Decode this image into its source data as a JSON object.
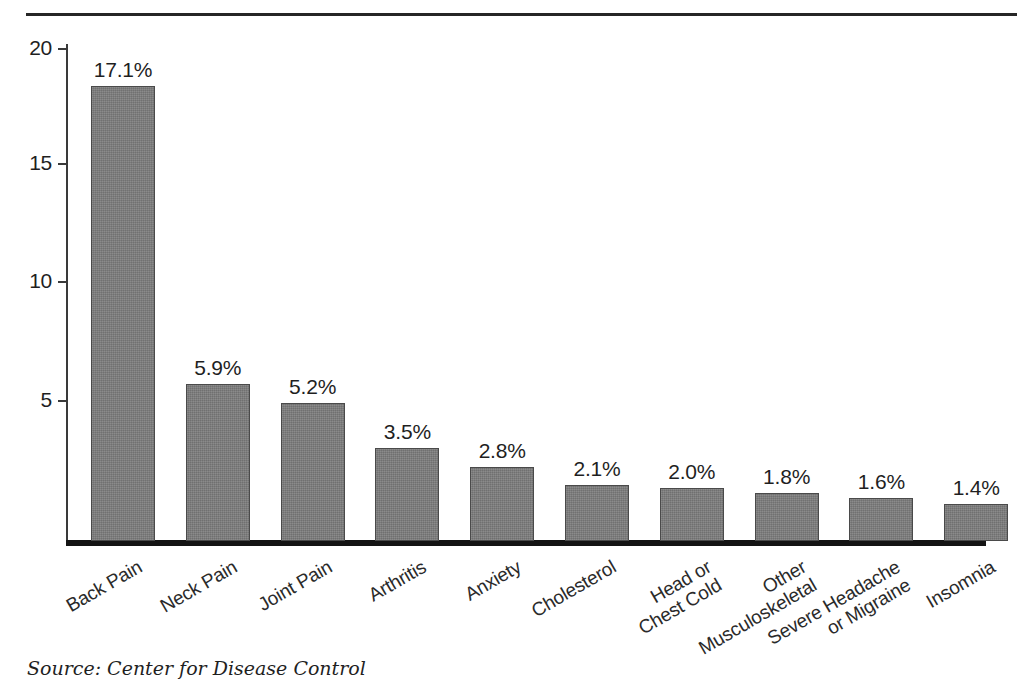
{
  "chart_data": {
    "type": "bar",
    "title": "",
    "subtitle": "",
    "xlabel": "",
    "ylabel": "",
    "ylim": [
      0,
      21
    ],
    "yticks": [
      5,
      10,
      15,
      20
    ],
    "ytick_labels": [
      "5",
      "10",
      "15",
      "20"
    ],
    "grid": false,
    "legend": false,
    "source_note": "Source: Center for Disease Control",
    "value_suffix": "%",
    "bar_color": "#7d7d7d",
    "bar_edge_color": "#4a4a4a",
    "axis_color": "#262626",
    "categories": [
      "Back Pain",
      "Neck Pain",
      "Joint Pain",
      "Arthritis",
      "Anxiety",
      "Cholesterol",
      "Head or Chest Cold",
      "Other Musculoskeletal",
      "Severe Headache or Migraine",
      "Insomnia"
    ],
    "category_lines": [
      [
        "Back Pain"
      ],
      [
        "Neck Pain"
      ],
      [
        "Joint Pain"
      ],
      [
        "Arthritis"
      ],
      [
        "Anxiety"
      ],
      [
        "Cholesterol"
      ],
      [
        "Head or",
        "Chest Cold"
      ],
      [
        "Other",
        "Musculoskeletal"
      ],
      [
        "Severe Headache",
        "or Migraine"
      ],
      [
        "Insomnia"
      ]
    ],
    "values": [
      17.1,
      5.9,
      5.2,
      3.5,
      2.8,
      2.1,
      2.0,
      1.8,
      1.6,
      1.4
    ],
    "value_labels": [
      "17.1%",
      "5.9%",
      "5.2%",
      "3.5%",
      "2.8%",
      "2.1%",
      "2.0%",
      "1.8%",
      "1.6%",
      "1.4%"
    ]
  }
}
